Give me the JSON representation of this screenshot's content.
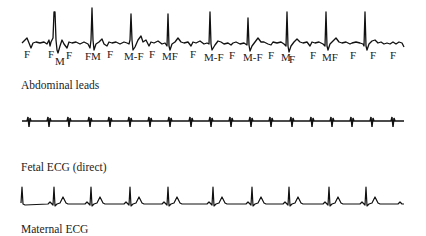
{
  "panels": [
    {
      "id": "abdominal",
      "caption": "Abdominal leads",
      "peak_labels": [
        {
          "text": "F",
          "x": 24,
          "y": 49
        },
        {
          "text": "F",
          "x": 48,
          "y": 49
        },
        {
          "text": "M",
          "x": 55,
          "y": 56
        },
        {
          "text": "F",
          "x": 66,
          "y": 50
        },
        {
          "text": "FM",
          "x": 85,
          "y": 51
        },
        {
          "text": "F",
          "x": 107,
          "y": 49
        },
        {
          "text": "M-F",
          "x": 124,
          "y": 51
        },
        {
          "text": "F",
          "x": 149,
          "y": 49
        },
        {
          "text": "MF",
          "x": 162,
          "y": 51
        },
        {
          "text": "F",
          "x": 190,
          "y": 49
        },
        {
          "text": "M-F",
          "x": 204,
          "y": 52
        },
        {
          "text": "F",
          "x": 229,
          "y": 50
        },
        {
          "text": "M-F",
          "x": 243,
          "y": 52
        },
        {
          "text": "F",
          "x": 268,
          "y": 50
        },
        {
          "text": "M",
          "x": 281,
          "y": 52
        },
        {
          "text": "F",
          "x": 289,
          "y": 54
        },
        {
          "text": "F",
          "x": 310,
          "y": 50
        },
        {
          "text": "MF",
          "x": 322,
          "y": 52
        },
        {
          "text": "F",
          "x": 350,
          "y": 50
        },
        {
          "text": "F",
          "x": 370,
          "y": 50
        },
        {
          "text": "F",
          "x": 390,
          "y": 50
        }
      ]
    },
    {
      "id": "fetal",
      "caption": "Fetal ECG (direct)"
    },
    {
      "id": "maternal",
      "caption": "Maternal ECG"
    }
  ],
  "legend": {
    "F": "Fetal complex",
    "M": "Maternal complex"
  }
}
